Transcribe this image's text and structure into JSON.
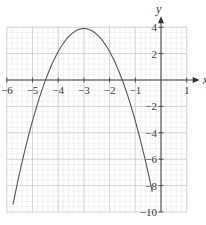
{
  "chart_data": {
    "type": "line",
    "title": "",
    "xlabel": "x",
    "ylabel": "y",
    "xlim": [
      -6,
      1
    ],
    "ylim": [
      -10,
      4
    ],
    "grid": true,
    "minor_grid_per_unit": 5,
    "x_ticks": [
      -6,
      -5,
      -4,
      -3,
      -2,
      -1,
      1
    ],
    "x_tick_labels": [
      "−6",
      "−5",
      "−4",
      "−3",
      "−2",
      "−1",
      "1"
    ],
    "y_ticks": [
      4,
      2,
      -2,
      -4,
      -6,
      -8,
      -10
    ],
    "y_tick_labels": [
      "4",
      "2",
      "−2",
      "−4",
      "−6",
      "−8",
      "−10"
    ],
    "series": [
      {
        "name": "parabola",
        "description": "downward-opening parabola, vertex near (-3, 3.9), roots near -4.5 and -1.5",
        "vertex": [
          -3,
          3.9
        ],
        "a": -1.75,
        "x_range": [
          -5.76,
          -0.34
        ],
        "x": [
          -5.76,
          -5.5,
          -5.0,
          -4.5,
          -4.0,
          -3.5,
          -3.0,
          -2.5,
          -2.0,
          -1.5,
          -1.0,
          -0.5,
          -0.34
        ],
        "y": [
          -9.4,
          -7.0,
          -3.1,
          0.0,
          2.2,
          3.5,
          3.9,
          3.5,
          2.2,
          0.0,
          -3.1,
          -7.0,
          -8.5
        ]
      }
    ],
    "colors": {
      "curve": "#555555",
      "grid_major": "#c8c8c8",
      "grid_minor": "#e4e4e4",
      "axes": "#333333"
    }
  }
}
